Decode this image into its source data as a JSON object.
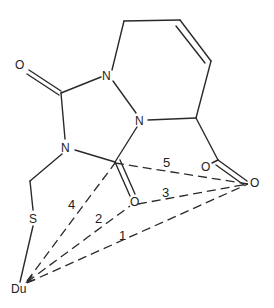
{
  "diagram": {
    "type": "chemical-structure",
    "atoms": {
      "o_carbonyl_top": "O",
      "n_upper": "N",
      "n_lower": "N",
      "n_left": "N",
      "s": "S",
      "du": "Du",
      "o_carbonyl_mid": "O",
      "o_carboxyl_left": "O",
      "o_carboxyl_right": "O"
    },
    "distance_labels": [
      "1",
      "2",
      "3",
      "4",
      "5"
    ]
  }
}
